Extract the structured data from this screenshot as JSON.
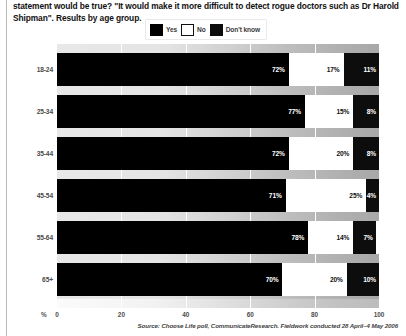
{
  "question": "statement would be true? \"It would make it more difficult to detect rogue doctors such as Dr Harold Shipman\". Results by age group.",
  "legend": {
    "items": [
      {
        "label": "Yes",
        "color": "#000000",
        "swatch": "yes"
      },
      {
        "label": "No",
        "color": "#ffffff",
        "swatch": "no"
      },
      {
        "label": "Don't know",
        "color": "#0d0d0d",
        "swatch": "dk"
      }
    ]
  },
  "axis": {
    "unit": "%",
    "ticks": [
      "0",
      "20",
      "40",
      "60",
      "80",
      "100"
    ],
    "min": 0,
    "max": 100
  },
  "source": "Source: Choose Life poll, CommunicateResearch. Fieldwork conducted 28 April–4 May 2006",
  "chart_data": {
    "type": "bar",
    "orientation": "horizontal",
    "stacked": true,
    "title": "statement would be true? \"It would make it more difficult to detect rogue doctors such as Dr Harold Shipman\". Results by age group.",
    "xlabel": "%",
    "ylabel": "",
    "xlim": [
      0,
      100
    ],
    "grid": false,
    "legend_position": "top-center",
    "categories": [
      "18-24",
      "25-34",
      "35-44",
      "45-54",
      "55-64",
      "65+"
    ],
    "series": [
      {
        "name": "Yes",
        "color": "#000000",
        "values": [
          72,
          77,
          72,
          71,
          78,
          70
        ],
        "labels": [
          "72%",
          "77%",
          "72%",
          "71%",
          "78%",
          "70%"
        ]
      },
      {
        "name": "No",
        "color": "#ffffff",
        "values": [
          17,
          15,
          20,
          25,
          14,
          20
        ],
        "labels": [
          "17%",
          "15%",
          "20%",
          "25%",
          "14%",
          "20%"
        ]
      },
      {
        "name": "Don't know",
        "color": "#0d0d0d",
        "values": [
          11,
          8,
          8,
          4,
          7,
          10
        ],
        "labels": [
          "11%",
          "8%",
          "8%",
          "4%",
          "7%",
          "10%"
        ]
      }
    ]
  }
}
